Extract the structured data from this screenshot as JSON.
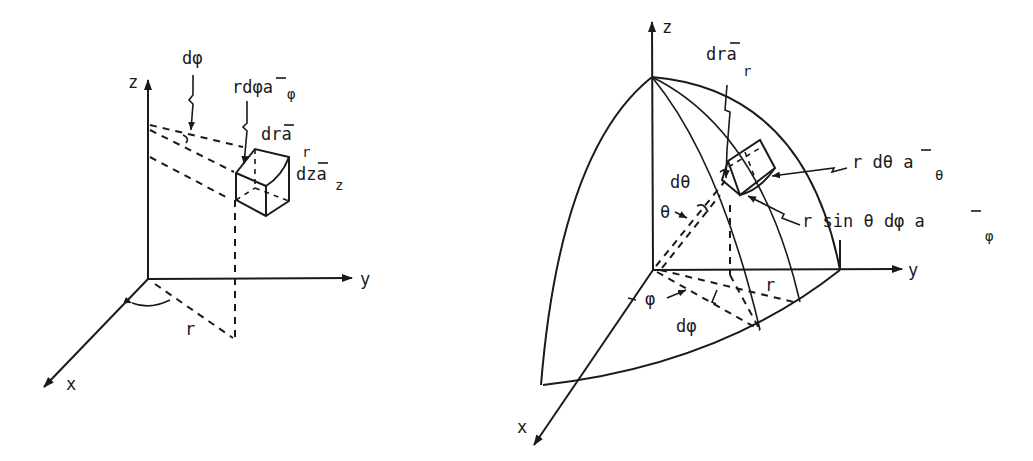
{
  "figure": {
    "colors": {
      "ink": "#1a1a1a",
      "background": "#ffffff"
    },
    "cylindrical": {
      "axes": {
        "z": "z",
        "y": "y",
        "x": "x"
      },
      "labels": {
        "radius": "r",
        "dphi": "dφ",
        "rdphi_main": "rdφa",
        "rdphi_sub": "φ",
        "dr_main": "dra",
        "dr_sub": "r",
        "dz_main": "dza",
        "dz_sub": "z"
      }
    },
    "spherical": {
      "axes": {
        "z": "z",
        "y": "y",
        "x": "x"
      },
      "labels": {
        "dr_main": "dra",
        "dr_sub": "r",
        "dtheta": "dθ",
        "theta": "θ",
        "phi": "φ",
        "dphi": "dφ",
        "radius": "r",
        "rdtheta_main": "r dθ a",
        "rdtheta_sub": "θ",
        "rsin_main": "r sin θ dφ  a",
        "rsin_sub": "φ"
      }
    }
  }
}
